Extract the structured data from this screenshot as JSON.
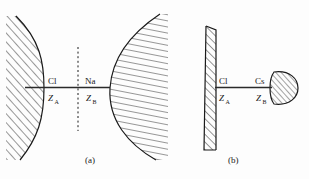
{
  "figure": {
    "background_color": "#fdfdfd",
    "ink_color": "#1a1a1a",
    "panels": [
      {
        "id": "a",
        "caption": "(a)",
        "left_species_label": "Cl",
        "left_coordinate_label": "Z",
        "left_coordinate_subscript": "A",
        "right_species_label": "Na",
        "right_coordinate_label": "Z",
        "right_coordinate_subscript": "B",
        "left_body": "convex-hatched-surface",
        "right_body": "large-hatched-sphere",
        "divider": "dashed-vertical-line",
        "hatch_left": "diagonal-hatch",
        "hatch_right": "horizontal-hatch"
      },
      {
        "id": "b",
        "caption": "(b)",
        "left_species_label": "Cl",
        "left_coordinate_label": "Z",
        "left_coordinate_subscript": "A",
        "right_species_label": "Cs",
        "right_coordinate_label": "Z",
        "right_coordinate_subscript": "B",
        "left_body": "flat-hatched-wall",
        "right_body": "small-hatched-blob",
        "divider": "none",
        "hatch_left": "diagonal-hatch",
        "hatch_right": "diagonal-hatch"
      }
    ]
  }
}
